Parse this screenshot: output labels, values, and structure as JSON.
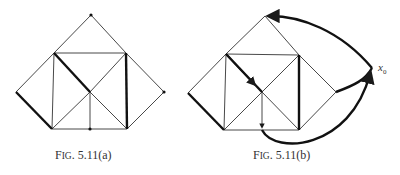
{
  "figures": [
    {
      "id": "a",
      "caption_prefix": "F",
      "caption_smallcaps": "IG",
      "caption_suffix": ". 5.11(a)"
    },
    {
      "id": "b",
      "caption_prefix": "F",
      "caption_smallcaps": "IG",
      "caption_suffix": ". 5.11(b)",
      "vertex_label": "x",
      "vertex_label_sub": "0"
    }
  ],
  "colors": {
    "line": "#2a2a2a",
    "background": "#ffffff"
  }
}
